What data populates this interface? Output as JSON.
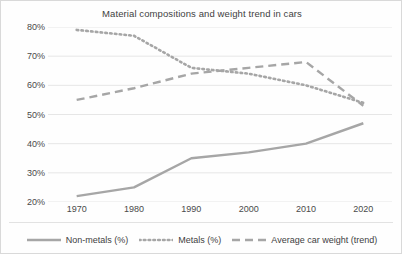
{
  "chart_data": {
    "type": "line",
    "title": "Material compositions and weight trend in cars",
    "xlabel": "",
    "ylabel": "",
    "x": [
      1970,
      1980,
      1990,
      2000,
      2010,
      2020
    ],
    "categories": [
      "1970",
      "1980",
      "1990",
      "2000",
      "2010",
      "2020"
    ],
    "xlim": [
      1965,
      2025
    ],
    "ylim": [
      20,
      80
    ],
    "yticks": [
      20,
      30,
      40,
      50,
      60,
      70,
      80
    ],
    "ytick_labels": [
      "20%",
      "30%",
      "40%",
      "50%",
      "60%",
      "70%",
      "80%"
    ],
    "grid": "horizontal",
    "legend_position": "bottom",
    "series": [
      {
        "name": "Non-metals (%)",
        "style": "solid",
        "color": "#a6a6a6",
        "values": [
          22,
          25,
          35,
          37,
          40,
          47
        ]
      },
      {
        "name": "Metals (%)",
        "style": "dotted",
        "color": "#a6a6a6",
        "values": [
          79,
          77,
          66,
          64,
          60,
          54
        ]
      },
      {
        "name": "Average car weight (trend)",
        "style": "dashed",
        "color": "#a6a6a6",
        "values": [
          55,
          59,
          64,
          66,
          68,
          53
        ]
      }
    ]
  },
  "colors": {
    "series_gray": "#a6a6a6",
    "gridline": "#e6e6e6",
    "text": "#3f3f3f",
    "background": "#fefefe"
  }
}
